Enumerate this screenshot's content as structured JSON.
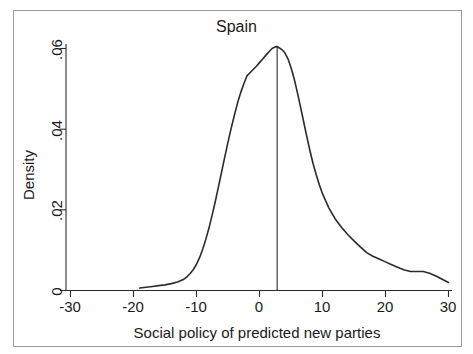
{
  "chart_data": {
    "type": "line",
    "title": "Spain",
    "xlabel": "Social policy of predicted new parties",
    "ylabel": "Density",
    "xlim": [
      -33,
      31
    ],
    "ylim": [
      0,
      0.0655
    ],
    "xticks": [
      -30,
      -20,
      -10,
      0,
      10,
      20,
      30
    ],
    "xtick_labels": [
      "-30",
      "-20",
      "-10",
      "0",
      "10",
      "20",
      "30"
    ],
    "yticks": [
      0,
      0.02,
      0.04,
      0.06
    ],
    "ytick_labels": [
      "0",
      ".02",
      ".04",
      ".06"
    ],
    "grid": false,
    "legend": false,
    "line_color": "#2b2b2b",
    "series": [
      {
        "name": "Kernel density of social policy",
        "x": [
          -19.0,
          -18.0,
          -17.0,
          -16.0,
          -15.0,
          -14.0,
          -13.0,
          -12.0,
          -11.5,
          -11.0,
          -10.5,
          -10.0,
          -9.5,
          -9.0,
          -8.5,
          -8.0,
          -7.5,
          -7.0,
          -6.5,
          -6.0,
          -5.5,
          -5.0,
          -4.5,
          -4.0,
          -3.5,
          -3.0,
          -2.5,
          -2.0,
          -1.5,
          -1.0,
          -0.5,
          0.0,
          0.5,
          1.0,
          1.5,
          2.0,
          2.5,
          2.8,
          3.5,
          4.0,
          4.5,
          5.0,
          5.5,
          6.0,
          6.5,
          7.0,
          7.5,
          8.0,
          8.5,
          9.0,
          9.5,
          10.0,
          11.0,
          12.0,
          13.0,
          14.0,
          15.0,
          16.0,
          17.0,
          18.0,
          19.0,
          20.0,
          21.0,
          22.0,
          23.0,
          24.0,
          25.0,
          26.0,
          27.0,
          28.0,
          29.0,
          30.0
        ],
        "y": [
          0.0006,
          0.0008,
          0.001,
          0.0012,
          0.0014,
          0.0017,
          0.0021,
          0.0028,
          0.0034,
          0.0042,
          0.0052,
          0.0065,
          0.0082,
          0.0103,
          0.0128,
          0.0156,
          0.0188,
          0.0222,
          0.0258,
          0.0295,
          0.0332,
          0.0368,
          0.0402,
          0.0434,
          0.0464,
          0.049,
          0.0512,
          0.0532,
          0.054,
          0.0548,
          0.0556,
          0.0565,
          0.0574,
          0.0583,
          0.0592,
          0.06,
          0.0604,
          0.0605,
          0.0598,
          0.059,
          0.0575,
          0.0553,
          0.0525,
          0.0492,
          0.0456,
          0.0419,
          0.0382,
          0.0347,
          0.0315,
          0.0287,
          0.0262,
          0.024,
          0.0205,
          0.0178,
          0.0157,
          0.0139,
          0.0123,
          0.0108,
          0.0094,
          0.0085,
          0.0078,
          0.0071,
          0.0064,
          0.0057,
          0.0051,
          0.0047,
          0.0047,
          0.0047,
          0.0043,
          0.0036,
          0.0028,
          0.002
        ]
      }
    ],
    "annotations": [
      {
        "type": "vertical-reference-line",
        "name": "mean-reference-line",
        "x": 2.8,
        "y_from": 0,
        "y_to": 0.0605
      }
    ]
  }
}
